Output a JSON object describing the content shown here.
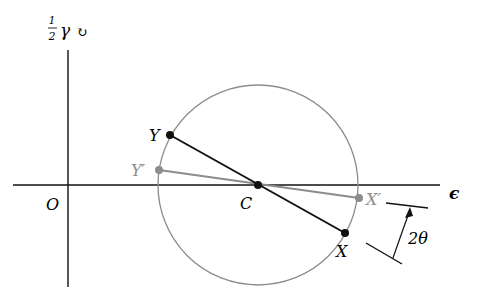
{
  "diagram": {
    "type": "mohr-circle-strain",
    "axes": {
      "vertical_label_frac_num": "1",
      "vertical_label_frac_den": "2",
      "vertical_label_symbol": "γ",
      "vertical_label_arrow": "↻",
      "horizontal_label": "ϵ",
      "origin_label": "O"
    },
    "points": {
      "center": {
        "label": "C"
      },
      "Y": {
        "label": "Y"
      },
      "X": {
        "label": "X"
      },
      "Y_prime": {
        "label": "Y′"
      },
      "X_prime": {
        "label": "X′"
      }
    },
    "angle_label": "2θ",
    "colors": {
      "axis": "#111111",
      "primary_line": "#111111",
      "rotated_line": "#8c8c8c",
      "circle": "#8c8c8c",
      "rotated_label": "#8c8c8c"
    }
  }
}
